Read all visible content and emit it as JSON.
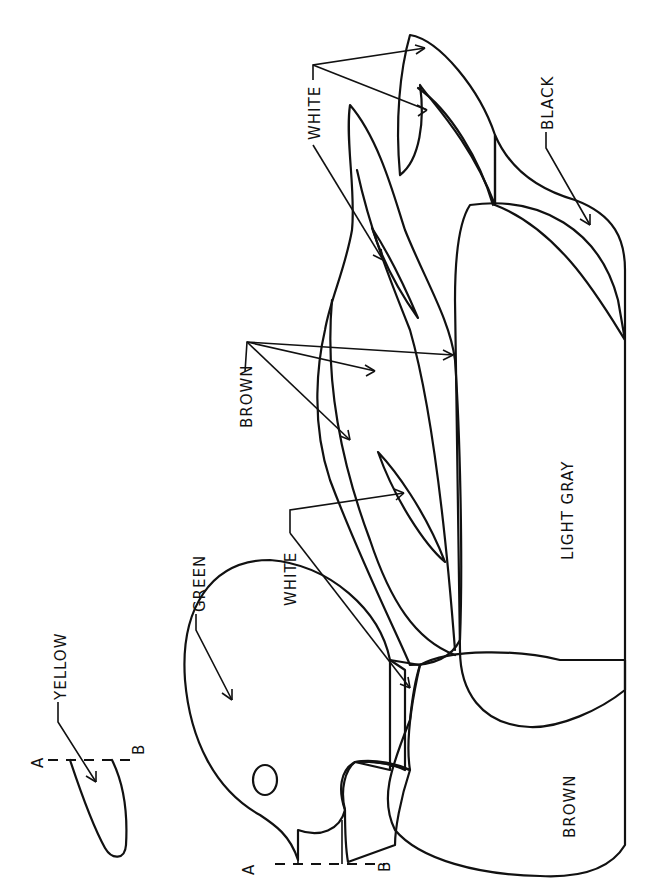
{
  "diagram": {
    "orientation": "rotated 90° counter-clockwise",
    "colors": {
      "brown": "#8f8f8f",
      "green": "#ababab",
      "light_gray": "#e9e9e9",
      "black": "#4d4d4d",
      "white": "#ffffff",
      "eye": "#4a4a4a",
      "line": "#111111"
    },
    "labels": {
      "yellow": "YELLOW",
      "green": "GREEN",
      "white_neck": "WHITE",
      "brown_wings": "BROWN",
      "white_tail": "WHITE",
      "black": "BLACK",
      "light_gray": "LIGHT GRAY",
      "brown_breast": "BROWN"
    },
    "section_markers": {
      "bill_detail_a": "A",
      "bill_detail_b": "B",
      "head_a": "A",
      "head_b": "B"
    },
    "regions": [
      {
        "name": "bill",
        "color_label": "YELLOW"
      },
      {
        "name": "head",
        "color_label": "GREEN"
      },
      {
        "name": "neck-ring",
        "color_label": "WHITE"
      },
      {
        "name": "wing-feathers",
        "color_label": "BROWN"
      },
      {
        "name": "wing-speculum",
        "color_label": "WHITE"
      },
      {
        "name": "tail",
        "color_label": "WHITE"
      },
      {
        "name": "undertail",
        "color_label": "BLACK"
      },
      {
        "name": "flank",
        "color_label": "LIGHT GRAY"
      },
      {
        "name": "breast",
        "color_label": "BROWN"
      }
    ]
  }
}
